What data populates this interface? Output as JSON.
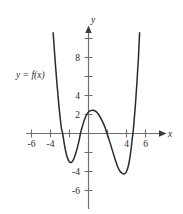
{
  "figure": {
    "name": "polynomial-graph",
    "function_label": "y = f(x)",
    "x_axis_name": "x",
    "y_axis_name": "y"
  },
  "chart_data": {
    "type": "line",
    "title": "",
    "subtitle": "",
    "xlabel": "x",
    "ylabel": "y",
    "annotations": [
      "y = f(x)"
    ],
    "legend": [],
    "legend_position": "none",
    "grid": false,
    "xlim": [
      -7.4,
      7.2
    ],
    "ylim": [
      -7.4,
      10.6
    ],
    "x_ticks": [
      -6,
      -4,
      -2,
      2,
      4,
      6
    ],
    "x_tick_labels": [
      "-6",
      "-4",
      "",
      "",
      "4",
      "6"
    ],
    "y_ticks": [
      -6,
      -4,
      -2,
      2,
      4,
      6,
      8,
      10
    ],
    "y_tick_labels": [
      "-6",
      "-4",
      "",
      "2",
      "4",
      "",
      "8",
      ""
    ],
    "series": [
      {
        "name": "f(x)",
        "color": "#2a2a2a",
        "points": [
          [
            -3.72,
            10.6
          ],
          [
            -3.55,
            8.2
          ],
          [
            -3.35,
            5.6
          ],
          [
            -3.15,
            3.3
          ],
          [
            -3.0,
            1.8
          ],
          [
            -2.85,
            0.55
          ],
          [
            -2.72,
            0.0
          ],
          [
            -2.55,
            -1.1
          ],
          [
            -2.35,
            -2.1
          ],
          [
            -2.1,
            -2.85
          ],
          [
            -1.9,
            -3.05
          ],
          [
            -1.7,
            -2.95
          ],
          [
            -1.5,
            -2.55
          ],
          [
            -1.3,
            -1.95
          ],
          [
            -1.1,
            -1.2
          ],
          [
            -0.95,
            -0.55
          ],
          [
            -0.85,
            0.0
          ],
          [
            -0.6,
            0.9
          ],
          [
            -0.35,
            1.65
          ],
          [
            -0.1,
            2.15
          ],
          [
            0.2,
            2.4
          ],
          [
            0.5,
            2.45
          ],
          [
            0.8,
            2.3
          ],
          [
            1.1,
            1.95
          ],
          [
            1.4,
            1.4
          ],
          [
            1.7,
            0.75
          ],
          [
            1.95,
            0.0
          ],
          [
            2.2,
            -0.75
          ],
          [
            2.5,
            -1.75
          ],
          [
            2.8,
            -2.7
          ],
          [
            3.05,
            -3.45
          ],
          [
            3.3,
            -3.95
          ],
          [
            3.55,
            -4.2
          ],
          [
            3.8,
            -4.25
          ],
          [
            4.0,
            -4.0
          ],
          [
            4.2,
            -3.4
          ],
          [
            4.35,
            -2.6
          ],
          [
            4.5,
            -1.5
          ],
          [
            4.62,
            -0.4
          ],
          [
            4.68,
            0.0
          ],
          [
            4.8,
            1.3
          ],
          [
            4.95,
            3.2
          ],
          [
            5.1,
            5.4
          ],
          [
            5.25,
            7.9
          ],
          [
            5.38,
            10.6
          ]
        ],
        "features": {
          "local_maximum": [
            0.45,
            2.45
          ],
          "local_minima": [
            [
              -1.9,
              -3.05
            ],
            [
              3.85,
              -4.25
            ]
          ],
          "x_intercepts": [
            -2.72,
            -0.85,
            1.95,
            4.68
          ]
        }
      }
    ]
  }
}
